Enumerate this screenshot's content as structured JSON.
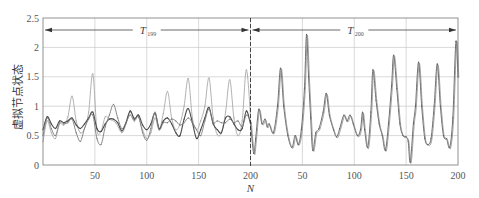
{
  "chart_data": {
    "type": "line",
    "title": "",
    "xlabel": "N",
    "ylabel": "虚拟节点状态",
    "ylim": [
      0,
      2.5
    ],
    "yticks": [
      "0",
      "0.5",
      "1",
      "1.5",
      "2",
      "2.5"
    ],
    "xlim": [
      0,
      400
    ],
    "xticks": [
      {
        "x": 50,
        "label": "50"
      },
      {
        "x": 100,
        "label": "100"
      },
      {
        "x": 150,
        "label": "150"
      },
      {
        "x": 200,
        "label": "200"
      },
      {
        "x": 250,
        "label": "50"
      },
      {
        "x": 300,
        "label": "100"
      },
      {
        "x": 350,
        "label": "150"
      },
      {
        "x": 400,
        "label": "200"
      }
    ],
    "grid": true,
    "divider_x": 200,
    "periods": [
      {
        "label": "T",
        "subscript": "199",
        "from": 0,
        "to": 200
      },
      {
        "label": "T",
        "subscript": "200",
        "from": 200,
        "to": 400
      }
    ],
    "series": [
      {
        "name": "state-light",
        "color": "#a8a8a8",
        "points": [
          [
            0,
            0.4
          ],
          [
            4,
            0.75
          ],
          [
            8,
            0.55
          ],
          [
            12,
            0.45
          ],
          [
            16,
            0.7
          ],
          [
            20,
            0.68
          ],
          [
            24,
            0.82
          ],
          [
            28,
            1.17
          ],
          [
            32,
            0.75
          ],
          [
            36,
            0.55
          ],
          [
            40,
            0.62
          ],
          [
            44,
            0.9
          ],
          [
            48,
            1.55
          ],
          [
            52,
            0.6
          ],
          [
            56,
            0.58
          ],
          [
            60,
            0.82
          ],
          [
            64,
            0.78
          ],
          [
            70,
            0.72
          ],
          [
            76,
            0.55
          ],
          [
            80,
            0.7
          ],
          [
            84,
            0.9
          ],
          [
            88,
            0.8
          ],
          [
            92,
            0.82
          ],
          [
            96,
            0.6
          ],
          [
            100,
            0.45
          ],
          [
            104,
            0.55
          ],
          [
            108,
            0.8
          ],
          [
            112,
            0.6
          ],
          [
            116,
            0.88
          ],
          [
            120,
            1.25
          ],
          [
            124,
            0.8
          ],
          [
            128,
            0.6
          ],
          [
            132,
            0.7
          ],
          [
            136,
            1.0
          ],
          [
            140,
            1.47
          ],
          [
            144,
            0.8
          ],
          [
            148,
            0.6
          ],
          [
            152,
            0.75
          ],
          [
            156,
            1.0
          ],
          [
            160,
            1.48
          ],
          [
            164,
            0.8
          ],
          [
            168,
            0.52
          ],
          [
            172,
            0.55
          ],
          [
            176,
            0.9
          ],
          [
            180,
            1.45
          ],
          [
            184,
            0.8
          ],
          [
            188,
            0.5
          ],
          [
            192,
            0.75
          ],
          [
            196,
            1.62
          ],
          [
            200,
            0.85
          ]
        ]
      },
      {
        "name": "state-dark",
        "color": "#4a4a4a",
        "points": [
          [
            0,
            0.6
          ],
          [
            4,
            0.82
          ],
          [
            8,
            0.7
          ],
          [
            12,
            0.62
          ],
          [
            16,
            0.75
          ],
          [
            20,
            0.72
          ],
          [
            24,
            0.75
          ],
          [
            28,
            0.8
          ],
          [
            32,
            0.68
          ],
          [
            36,
            0.62
          ],
          [
            40,
            0.7
          ],
          [
            44,
            0.8
          ],
          [
            48,
            0.9
          ],
          [
            52,
            0.62
          ],
          [
            56,
            0.57
          ],
          [
            60,
            0.7
          ],
          [
            64,
            0.78
          ],
          [
            68,
            0.78
          ],
          [
            72,
            0.72
          ],
          [
            76,
            0.58
          ],
          [
            80,
            0.72
          ],
          [
            84,
            0.92
          ],
          [
            88,
            0.78
          ],
          [
            92,
            0.85
          ],
          [
            96,
            0.68
          ],
          [
            100,
            0.6
          ],
          [
            104,
            0.7
          ],
          [
            108,
            0.88
          ],
          [
            112,
            0.62
          ],
          [
            116,
            0.75
          ],
          [
            120,
            0.8
          ],
          [
            124,
            0.7
          ],
          [
            128,
            0.55
          ],
          [
            132,
            0.5
          ],
          [
            136,
            0.78
          ],
          [
            140,
            0.96
          ],
          [
            144,
            0.72
          ],
          [
            148,
            0.45
          ],
          [
            152,
            0.6
          ],
          [
            156,
            0.8
          ],
          [
            160,
            0.98
          ],
          [
            164,
            0.7
          ],
          [
            168,
            0.6
          ],
          [
            172,
            0.55
          ],
          [
            176,
            0.8
          ],
          [
            180,
            0.82
          ],
          [
            184,
            0.7
          ],
          [
            188,
            0.6
          ],
          [
            192,
            0.62
          ],
          [
            196,
            0.92
          ],
          [
            200,
            0.7
          ]
        ]
      },
      {
        "name": "state-mid",
        "color": "#7a7a7a",
        "points": [
          [
            0,
            0.5
          ],
          [
            4,
            0.8
          ],
          [
            8,
            0.62
          ],
          [
            12,
            0.5
          ],
          [
            16,
            0.72
          ],
          [
            20,
            0.7
          ],
          [
            24,
            0.72
          ],
          [
            28,
            0.78
          ],
          [
            32,
            0.55
          ],
          [
            36,
            0.4
          ],
          [
            40,
            0.62
          ],
          [
            44,
            0.78
          ],
          [
            48,
            0.85
          ],
          [
            52,
            0.45
          ],
          [
            56,
            0.35
          ],
          [
            60,
            0.65
          ],
          [
            64,
            0.85
          ],
          [
            68,
            1.03
          ],
          [
            72,
            0.8
          ],
          [
            76,
            0.62
          ],
          [
            80,
            0.72
          ],
          [
            84,
            0.85
          ],
          [
            88,
            0.75
          ],
          [
            92,
            0.82
          ],
          [
            96,
            0.55
          ],
          [
            100,
            0.42
          ],
          [
            104,
            0.62
          ],
          [
            108,
            0.9
          ],
          [
            112,
            0.6
          ],
          [
            116,
            0.72
          ],
          [
            120,
            0.72
          ],
          [
            124,
            0.78
          ],
          [
            128,
            0.75
          ],
          [
            132,
            0.68
          ],
          [
            136,
            0.72
          ],
          [
            140,
            0.8
          ],
          [
            144,
            0.72
          ],
          [
            148,
            0.6
          ],
          [
            152,
            0.5
          ],
          [
            156,
            0.75
          ],
          [
            160,
            0.95
          ],
          [
            164,
            0.72
          ],
          [
            168,
            0.75
          ],
          [
            172,
            0.72
          ],
          [
            176,
            0.72
          ],
          [
            180,
            0.78
          ],
          [
            184,
            0.72
          ],
          [
            188,
            0.75
          ],
          [
            192,
            0.65
          ],
          [
            196,
            0.85
          ],
          [
            200,
            0.75
          ]
        ]
      },
      {
        "name": "state-converged",
        "color": "#5a5a5a",
        "points": [
          [
            200,
            0.75
          ],
          [
            203,
            0.2
          ],
          [
            205,
            0.45
          ],
          [
            208,
            0.95
          ],
          [
            211,
            0.7
          ],
          [
            214,
            0.78
          ],
          [
            216,
            0.65
          ],
          [
            218,
            0.7
          ],
          [
            222,
            0.55
          ],
          [
            226,
            1.0
          ],
          [
            229,
            1.65
          ],
          [
            232,
            1.0
          ],
          [
            236,
            0.5
          ],
          [
            240,
            0.3
          ],
          [
            243,
            0.5
          ],
          [
            246,
            0.35
          ],
          [
            249,
            0.6
          ],
          [
            252,
            1.3
          ],
          [
            254,
            2.22
          ],
          [
            256,
            1.5
          ],
          [
            258,
            0.8
          ],
          [
            260,
            0.25
          ],
          [
            263,
            0.55
          ],
          [
            266,
            0.62
          ],
          [
            270,
            0.9
          ],
          [
            273,
            1.22
          ],
          [
            276,
            0.85
          ],
          [
            280,
            0.6
          ],
          [
            283,
            0.48
          ],
          [
            286,
            0.62
          ],
          [
            290,
            0.85
          ],
          [
            293,
            0.75
          ],
          [
            296,
            0.85
          ],
          [
            299,
            0.7
          ],
          [
            303,
            0.5
          ],
          [
            306,
            0.6
          ],
          [
            308,
            0.9
          ],
          [
            310,
            0.6
          ],
          [
            313,
            0.3
          ],
          [
            316,
            0.9
          ],
          [
            318,
            1.62
          ],
          [
            321,
            1.1
          ],
          [
            324,
            0.7
          ],
          [
            327,
            0.5
          ],
          [
            330,
            0.25
          ],
          [
            333,
            0.7
          ],
          [
            336,
            1.35
          ],
          [
            338,
            1.87
          ],
          [
            341,
            1.3
          ],
          [
            344,
            0.7
          ],
          [
            347,
            0.5
          ],
          [
            350,
            0.48
          ],
          [
            352,
            0.4
          ],
          [
            354,
            0.05
          ],
          [
            357,
            0.7
          ],
          [
            359,
            1.0
          ],
          [
            362,
            1.75
          ],
          [
            365,
            1.0
          ],
          [
            368,
            0.45
          ],
          [
            371,
            0.35
          ],
          [
            374,
            0.45
          ],
          [
            377,
            1.0
          ],
          [
            380,
            1.72
          ],
          [
            383,
            1.0
          ],
          [
            386,
            0.5
          ],
          [
            389,
            0.45
          ],
          [
            392,
            0.3
          ],
          [
            395,
            0.8
          ],
          [
            398,
            2.1
          ],
          [
            400,
            1.5
          ]
        ]
      }
    ]
  }
}
